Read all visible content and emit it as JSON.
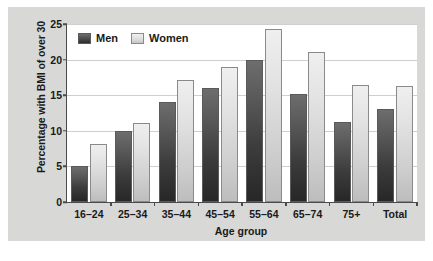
{
  "chart_data": {
    "type": "bar",
    "title": "",
    "xlabel": "Age group",
    "ylabel": "Percentage with BMI of over 30",
    "categories": [
      "16–24",
      "25–34",
      "35–44",
      "45–54",
      "55–64",
      "65–74",
      "75+",
      "Total"
    ],
    "series": [
      {
        "name": "Men",
        "color": "#3c3c3c",
        "values": [
          5.0,
          10.0,
          14.0,
          16.0,
          20.0,
          15.2,
          11.3,
          13.1
        ]
      },
      {
        "name": "Women",
        "color": "#d9d9d9",
        "values": [
          8.2,
          11.1,
          17.1,
          19.0,
          24.3,
          21.1,
          16.4,
          16.3
        ]
      }
    ],
    "ylim": [
      0,
      25
    ],
    "yticks": [
      0,
      5,
      10,
      15,
      20,
      25
    ],
    "ytick_labels": [
      "0",
      "5",
      "10",
      "15",
      "20",
      "25"
    ],
    "grid": true,
    "legend_position": "top-left",
    "panel_background": "#d8d8d6",
    "plot_background": "#ffffff",
    "axis_color": "#4a4a4a",
    "grid_color": "#cfcfcf"
  }
}
